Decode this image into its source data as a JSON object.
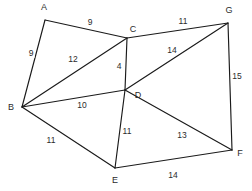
{
  "figure": {
    "width": 252,
    "height": 191,
    "background_color": "#ffffff",
    "line_color": "#1a1a1a",
    "text_color": "#2b2b2b"
  },
  "chart_data": {
    "type": "diagram",
    "diagram_type": "weighted-undirected-graph",
    "title": "",
    "xlabel": "",
    "ylabel": "",
    "grid": false,
    "legend": "none",
    "nodes": [
      {
        "id": "A",
        "label": "A",
        "x": 45,
        "y": 20,
        "label_x": 44,
        "label_y": 7
      },
      {
        "id": "B",
        "label": "B",
        "x": 22,
        "y": 107,
        "label_x": 11,
        "label_y": 107
      },
      {
        "id": "C",
        "label": "C",
        "x": 127,
        "y": 38,
        "label_x": 133,
        "label_y": 29
      },
      {
        "id": "D",
        "label": "D",
        "x": 125,
        "y": 90,
        "label_x": 138,
        "label_y": 95
      },
      {
        "id": "E",
        "label": "E",
        "x": 115,
        "y": 168,
        "label_x": 115,
        "label_y": 180
      },
      {
        "id": "F",
        "label": "F",
        "x": 232,
        "y": 150,
        "label_x": 240,
        "label_y": 153
      },
      {
        "id": "G",
        "label": "G",
        "x": 228,
        "y": 23,
        "label_x": 229,
        "label_y": 10
      }
    ],
    "edges": [
      {
        "id": "A-C",
        "source": "A",
        "target": "C",
        "weight": "9",
        "label_x": 90,
        "label_y": 22
      },
      {
        "id": "A-B",
        "source": "A",
        "target": "B",
        "weight": "9",
        "label_x": 31,
        "label_y": 53
      },
      {
        "id": "B-C",
        "source": "B",
        "target": "C",
        "weight": "12",
        "label_x": 73,
        "label_y": 59
      },
      {
        "id": "C-D",
        "source": "C",
        "target": "D",
        "weight": "4",
        "label_x": 119,
        "label_y": 66
      },
      {
        "id": "C-G",
        "source": "C",
        "target": "G",
        "weight": "11",
        "label_x": 183,
        "label_y": 21
      },
      {
        "id": "B-D",
        "source": "B",
        "target": "D",
        "weight": "10",
        "label_x": 82,
        "label_y": 105
      },
      {
        "id": "D-G",
        "source": "D",
        "target": "G",
        "weight": "14",
        "label_x": 172,
        "label_y": 50
      },
      {
        "id": "G-F",
        "source": "G",
        "target": "F",
        "weight": "15",
        "label_x": 237,
        "label_y": 76
      },
      {
        "id": "D-F",
        "source": "D",
        "target": "F",
        "weight": "13",
        "label_x": 182,
        "label_y": 135
      },
      {
        "id": "B-E",
        "source": "B",
        "target": "E",
        "weight": "11",
        "label_x": 51,
        "label_y": 140
      },
      {
        "id": "D-E",
        "source": "D",
        "target": "E",
        "weight": "11",
        "label_x": 127,
        "label_y": 131
      },
      {
        "id": "E-F",
        "source": "E",
        "target": "F",
        "weight": "14",
        "label_x": 173,
        "label_y": 175
      }
    ]
  }
}
